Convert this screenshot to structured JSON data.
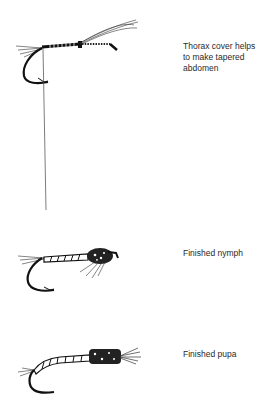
{
  "figures": [
    {
      "id": "thorax-step",
      "caption_lines": [
        "Thorax cover helps",
        "to make tapered",
        "abdomen"
      ]
    },
    {
      "id": "finished-nymph",
      "caption_lines": [
        "Finished nymph"
      ]
    },
    {
      "id": "finished-pupa",
      "caption_lines": [
        "Finished pupa"
      ]
    }
  ]
}
